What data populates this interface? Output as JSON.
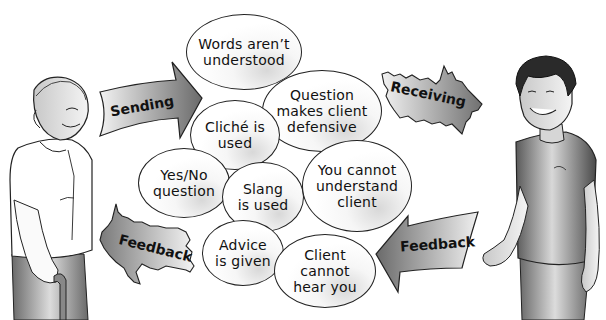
{
  "diagram": {
    "arrows": {
      "sending": "Sending",
      "receiving": "Receiving",
      "feedback_left": "Feedback",
      "feedback_right": "Feedback"
    },
    "barriers": [
      {
        "id": "words",
        "label": "Words aren’t\nunderstood"
      },
      {
        "id": "question-defensive",
        "label": "Question\nmakes client\ndefensive"
      },
      {
        "id": "cliche",
        "label": "Cliché is\nused"
      },
      {
        "id": "yes-no",
        "label": "Yes/No\nquestion"
      },
      {
        "id": "slang",
        "label": "Slang\nis used"
      },
      {
        "id": "cannot-understand",
        "label": "You cannot\nunderstand\nclient"
      },
      {
        "id": "advice",
        "label": "Advice\nis given"
      },
      {
        "id": "cannot-hear",
        "label": "Client\ncannot\nhear you"
      }
    ],
    "figures": {
      "sender": "older woman with cane",
      "receiver": "young man"
    },
    "colors": {
      "outline": "#222222",
      "arrow_dark": "#6a6a6a",
      "arrow_light": "#f0f0f0"
    }
  }
}
